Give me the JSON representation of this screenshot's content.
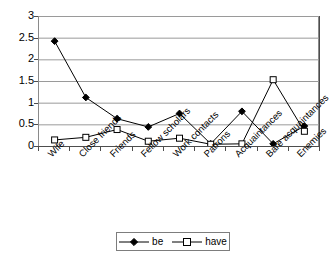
{
  "chart_data": {
    "type": "line",
    "title": "",
    "xlabel": "",
    "ylabel": "",
    "ylim": [
      0,
      3
    ],
    "ytick_labels": [
      "3",
      "2.5",
      "2",
      "1.5",
      "1",
      "0.5",
      "0"
    ],
    "ytick_values": [
      3,
      2.5,
      2,
      1.5,
      1,
      0.5,
      0
    ],
    "grid": "horizontal",
    "legend_position": "bottom-center",
    "categories": [
      "Wife",
      "Close friends",
      "Friends",
      "Fellow scholars",
      "Work contacts",
      "Patrons",
      "Acquaintances",
      "Bare acquaintances",
      "Enemies"
    ],
    "series": [
      {
        "name": "be",
        "marker": "filled-diamond",
        "color": "#000000",
        "values": [
          2.42,
          1.12,
          0.63,
          0.44,
          0.75,
          0.05,
          0.8,
          0.05,
          0.46
        ]
      },
      {
        "name": "have",
        "marker": "open-square",
        "color": "#000000",
        "values": [
          0.14,
          0.2,
          0.38,
          0.11,
          0.18,
          0.04,
          0.05,
          1.53,
          0.34
        ]
      }
    ]
  },
  "legend": {
    "items": [
      {
        "label": "be",
        "marker": "filled-diamond"
      },
      {
        "label": "have",
        "marker": "open-square"
      }
    ]
  },
  "colors": {
    "axis": "#4d4d4d",
    "gridline": "#9a9a9a",
    "series": "#000000",
    "legend_border": "#7d7d7d",
    "background": "#ffffff"
  }
}
